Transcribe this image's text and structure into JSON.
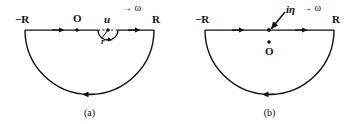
{
  "figure": {
    "background_color": "#fefefe",
    "stroke_color": "#111111",
    "panels": [
      {
        "id": "a",
        "caption": "(a)",
        "direction_label": "→ ω",
        "left_endpoint_label": "−R",
        "right_endpoint_label": "R",
        "origin_label": "O",
        "pole_label": "u",
        "radius_label": "r",
        "contour_type": "semicircle-lower-half-plane",
        "indentation": {
          "present": true,
          "shape": "small-semicircle-below-axis",
          "around": "u",
          "radius_label": "r",
          "dashed_chord": true
        },
        "orientation": "clockwise",
        "axis_arrow_direction": "right",
        "arc_arrow_direction": "left"
      },
      {
        "id": "b",
        "caption": "(b)",
        "direction_label": "→ ω",
        "left_endpoint_label": "−R",
        "right_endpoint_label": "R",
        "origin_label": "O",
        "pole_label": "iη",
        "contour_type": "semicircle-lower-half-plane",
        "indentation": {
          "present": false
        },
        "pole_marker": {
          "on_axis_dot": true,
          "annotation_arrow": "diagonal-from-upper-right",
          "origin_dot_below_axis": true
        },
        "orientation": "clockwise",
        "axis_arrow_direction": "right",
        "arc_arrow_direction": "left"
      }
    ]
  }
}
